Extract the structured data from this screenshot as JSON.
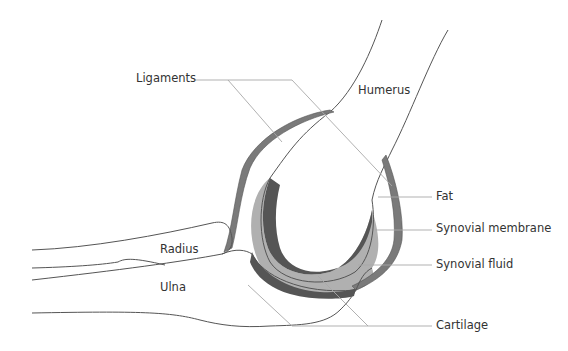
{
  "diagram": {
    "labels": {
      "ligaments": "Ligaments",
      "humerus": "Humerus",
      "fat": "Fat",
      "synovial_membrane": "Synovial membrane",
      "synovial_fluid": "Synovial fluid",
      "radius": "Radius",
      "ulna": "Ulna",
      "cartilage": "Cartilage"
    },
    "colors": {
      "background": "#ffffff",
      "bone_outline": "#555555",
      "ligament": "#7a7a7a",
      "cartilage": "#555555",
      "synovial_fluid": "#b0b0b0",
      "leader_line": "#a8a8a8",
      "text": "#333333"
    }
  }
}
